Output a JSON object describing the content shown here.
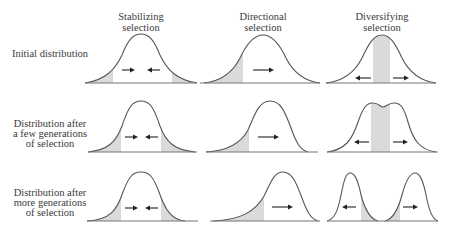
{
  "columns": [
    {
      "line1": "Stabilizing",
      "line2": "selection"
    },
    {
      "line1": "Directional",
      "line2": "selection"
    },
    {
      "line1": "Diversifying",
      "line2": "selection"
    }
  ],
  "rows": [
    {
      "lines": [
        "Initial distribution"
      ]
    },
    {
      "lines": [
        "Distribution after",
        "a few generations",
        "of selection"
      ]
    },
    {
      "lines": [
        "Distribution after",
        "more generations",
        "of selection"
      ]
    }
  ],
  "colors": {
    "curve": "#555555",
    "shading": "#dadada",
    "arrow": "#222222",
    "text": "#3a3a3a"
  }
}
